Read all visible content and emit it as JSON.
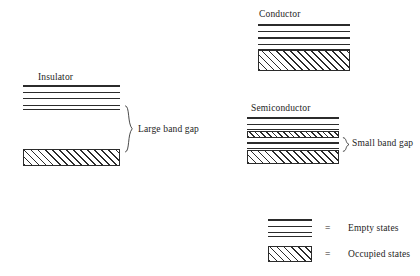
{
  "diagram": {
    "title": "",
    "background_color": "#ffffff",
    "line_color": "#2b2b2b",
    "text_color": "#1d1d1d"
  },
  "materials": [
    {
      "id": "insulator",
      "label": "Insulator",
      "gap_label": "Large band gap",
      "gap_size": "large",
      "bands": [
        {
          "type": "empty",
          "name": "conduction-band"
        },
        {
          "type": "occupied",
          "name": "valence-band"
        }
      ]
    },
    {
      "id": "conductor",
      "label": "Conductor",
      "gap_label": "",
      "gap_size": "none",
      "bands": [
        {
          "type": "empty",
          "name": "conduction-band"
        },
        {
          "type": "occupied",
          "name": "valence-band"
        }
      ]
    },
    {
      "id": "semiconductor",
      "label": "Semiconductor",
      "gap_label": "Small band gap",
      "gap_size": "small",
      "bands": [
        {
          "type": "empty",
          "name": "conduction-band"
        },
        {
          "type": "occupied",
          "name": "donor-band"
        },
        {
          "type": "empty",
          "name": "upper-valence-band"
        },
        {
          "type": "occupied",
          "name": "valence-band"
        }
      ]
    }
  ],
  "legend": {
    "equals_sign": "=",
    "items": [
      {
        "key": "empty",
        "label": "Empty states"
      },
      {
        "key": "occupied",
        "label": "Occupied states"
      }
    ]
  }
}
